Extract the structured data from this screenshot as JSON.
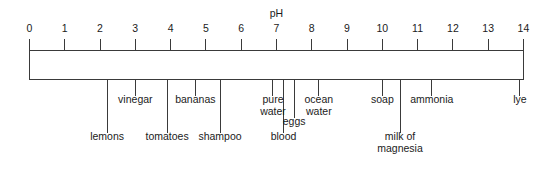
{
  "chart_data": {
    "type": "scale-diagram",
    "title": "pH",
    "axis": {
      "label": "pH",
      "min": 0,
      "max": 14,
      "ticks": [
        "0",
        "1",
        "2",
        "3",
        "4",
        "5",
        "6",
        "7",
        "8",
        "9",
        "10",
        "11",
        "12",
        "13",
        "14"
      ],
      "tick_values": [
        0,
        1,
        2,
        3,
        4,
        5,
        6,
        7,
        8,
        9,
        10,
        11,
        12,
        13,
        14
      ],
      "orientation": "horizontal",
      "grid": false,
      "legend": "none"
    },
    "items": [
      {
        "label": "lemons",
        "line1": "lemons",
        "line2": "",
        "value": 2.2,
        "row": "lower"
      },
      {
        "label": "vinegar",
        "line1": "vinegar",
        "line2": "",
        "value": 3.0,
        "row": "upper"
      },
      {
        "label": "tomatoes",
        "line1": "tomatoes",
        "line2": "",
        "value": 3.9,
        "row": "lower"
      },
      {
        "label": "bananas",
        "line1": "bananas",
        "line2": "",
        "value": 4.7,
        "row": "upper"
      },
      {
        "label": "shampoo",
        "line1": "shampoo",
        "line2": "",
        "value": 5.4,
        "row": "lower"
      },
      {
        "label": "pure water",
        "line1": "pure",
        "line2": "water",
        "value": 6.9,
        "row": "upper"
      },
      {
        "label": "blood",
        "line1": "blood",
        "line2": "",
        "value": 7.2,
        "row": "lower"
      },
      {
        "label": "eggs",
        "line1": "eggs",
        "line2": "",
        "value": 7.5,
        "row": "middle"
      },
      {
        "label": "ocean water",
        "line1": "ocean",
        "line2": "water",
        "value": 8.2,
        "row": "upper"
      },
      {
        "label": "soap",
        "line1": "soap",
        "line2": "",
        "value": 10.0,
        "row": "upper"
      },
      {
        "label": "milk of magnesia",
        "line1": "milk of",
        "line2": "magnesia",
        "value": 10.5,
        "row": "lower"
      },
      {
        "label": "ammonia",
        "line1": "ammonia",
        "line2": "",
        "value": 11.4,
        "row": "upper"
      },
      {
        "label": "lye",
        "line1": "lye",
        "line2": "",
        "value": 13.9,
        "row": "upper"
      }
    ],
    "colors": {
      "stroke": "#3a3a3a",
      "text": "#1b1b1b",
      "background": "#ffffff"
    }
  }
}
